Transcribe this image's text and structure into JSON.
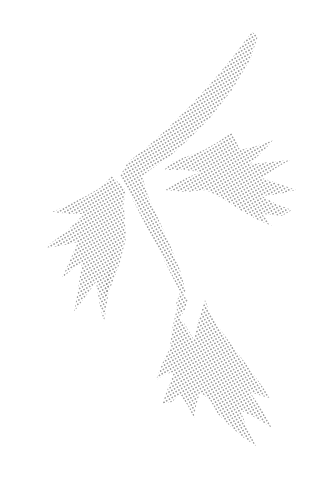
{
  "image": {
    "subject": "Halftone dotted illustration of a leafy branch",
    "background_color": "#ffffff",
    "dot_color": "#8a8a8a",
    "parts": [
      {
        "name": "stem",
        "description": "long diagonal stem from upper right to lower center"
      },
      {
        "name": "leaf-cluster-left",
        "description": "jagged leaves on the left side"
      },
      {
        "name": "leaf-cluster-right",
        "description": "jagged leaves on the right of the fork"
      },
      {
        "name": "leaf-cluster-bottom",
        "description": "jagged leaves at the bottom"
      }
    ]
  }
}
